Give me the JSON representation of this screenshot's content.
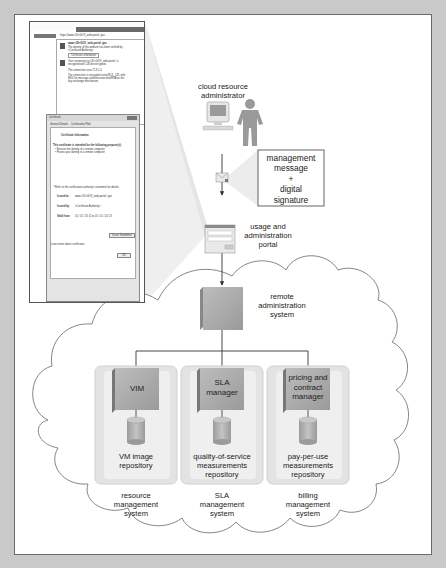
{
  "diagram": {
    "actors": {
      "administrator": "cloud resource\nadministrator"
    },
    "message_box": "management\nmessage\n+\ndigital\nsignature",
    "portal": "usage and\nadministration\nportal",
    "remote_admin": "remote\nadministration\nsystem",
    "systems": [
      {
        "component": "VIM",
        "repository": "VM image\nrepository",
        "label": "resource\nmanagement\nsystem"
      },
      {
        "component": "SLA\nmanager",
        "repository": "quality-of-service\nmeasurements\nrepository",
        "label": "SLA\nmanagement\nsystem"
      },
      {
        "component": "pricing and\ncontract\nmanager",
        "repository": "pay-per-use\nmeasurements\nrepository",
        "label": "billing\nmanagement\nsystem"
      }
    ],
    "browser_screenshot": {
      "url": "https://www.<ID>GOV_web-portal·.gov",
      "site_id_title": "www.<ID>GOV_web-portal·.gov",
      "site_id_text": "The identity of this website has been verified by <Certificate Authority>",
      "cert_info_button": "Certificate information",
      "encryption_text": "Your connection to <ID>GOV_web-portal· is encrypted with 128-bit encryption.",
      "tls_text": "The connection uses TLS 1.0.",
      "cipher_text": "The connection is encrypted using RC4_128, with MD5 for message authentication and RSA as the key exchange mechanism.",
      "cert_dialog": {
        "title": "Certificate",
        "tabs": [
          "General",
          "Details",
          "Certification Path"
        ],
        "heading": "Certificate Information",
        "purpose_title": "This certificate is intended for the following purpose(s):",
        "purposes": [
          "• Ensures the identity of a remote computer",
          "• Proves your identity to a remote computer"
        ],
        "ref_text": "* Refer to the certification authority's statement for details.",
        "issued_to_label": "Issued to:",
        "issued_to": "www.<ID>GOV_web-portal·.gov",
        "issued_by_label": "Issued by:",
        "issued_by": "<Certificate Authority>",
        "valid_label": "Valid from",
        "valid": "01 / 01 / 20 11  to  01 / 01 / 20 13",
        "issuer_button": "Issuer Statement",
        "learn_more": "Learn more about certificates",
        "ok_button": "OK"
      }
    }
  }
}
